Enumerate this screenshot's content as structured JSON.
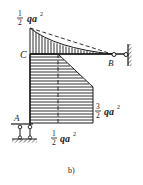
{
  "figure": {
    "caption": "b)",
    "type": "bending moment diagram"
  },
  "labels": {
    "point_c": "C",
    "point_b": "B",
    "point_a": "A"
  },
  "annotations": {
    "top_moment": {
      "num": "1",
      "den": "2",
      "expr": "qa",
      "exp": "2"
    },
    "right_moment": {
      "num": "3",
      "den": "2",
      "expr": "qa",
      "exp": "2"
    },
    "bottom_moment": {
      "num": "1",
      "den": "2",
      "expr": "qa",
      "exp": "2"
    }
  },
  "colors": {
    "line": "#1a1a1a",
    "background": "#ffffff"
  }
}
